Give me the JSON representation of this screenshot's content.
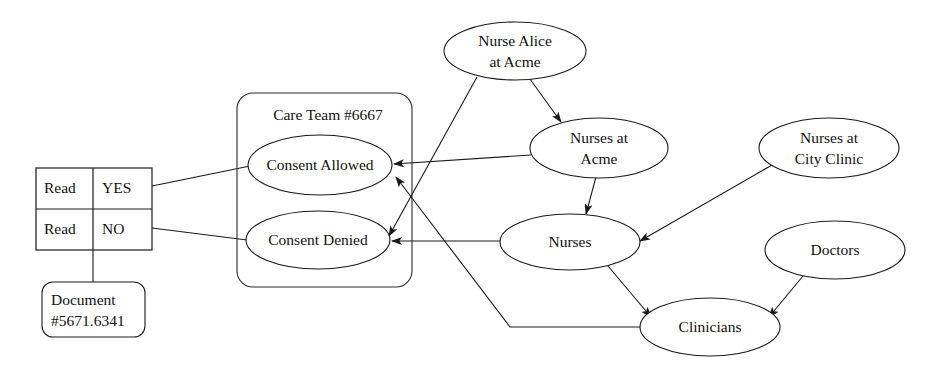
{
  "diagram": {
    "background_color": "#ffffff",
    "line_color": "#1a1a1a",
    "text_color": "#111111"
  },
  "permission_table": {
    "name": "read-permission-table",
    "rows": [
      {
        "action": "Read",
        "value": "YES"
      },
      {
        "action": "Read",
        "value": "NO"
      }
    ]
  },
  "document": {
    "line1": "Document",
    "line2": "#5671.6341"
  },
  "care_team": {
    "label": "Care Team #6667",
    "nodes": [
      {
        "id": "consent-allowed",
        "label": "Consent Allowed"
      },
      {
        "id": "consent-denied",
        "label": "Consent Denied"
      }
    ]
  },
  "actors": [
    {
      "id": "nurse-alice-at-acme",
      "line1": "Nurse Alice",
      "line2": "at Acme"
    },
    {
      "id": "nurses-at-acme",
      "line1": "Nurses at",
      "line2": "Acme"
    },
    {
      "id": "nurses-at-city-clinic",
      "line1": "Nurses at",
      "line2": "City Clinic"
    },
    {
      "id": "nurses",
      "line1": "Nurses",
      "line2": ""
    },
    {
      "id": "doctors",
      "line1": "Doctors",
      "line2": ""
    },
    {
      "id": "clinicians",
      "line1": "Clinicians",
      "line2": ""
    }
  ],
  "edges": [
    {
      "id": "edge-read-yes-to-consent-allowed",
      "from": "read-yes",
      "to": "consent-allowed",
      "arrow": false
    },
    {
      "id": "edge-read-no-to-consent-denied",
      "from": "read-no",
      "to": "consent-denied",
      "arrow": false
    },
    {
      "id": "edge-table-to-document",
      "from": "read-permission-table",
      "to": "document",
      "arrow": false
    },
    {
      "id": "edge-nurse-alice-to-nurses-at-acme",
      "from": "nurse-alice-at-acme",
      "to": "nurses-at-acme",
      "arrow": true
    },
    {
      "id": "edge-nurse-alice-to-consent-denied",
      "from": "nurse-alice-at-acme",
      "to": "consent-denied",
      "arrow": true
    },
    {
      "id": "edge-nurses-at-acme-to-consent-allowed",
      "from": "nurses-at-acme",
      "to": "consent-allowed",
      "arrow": true
    },
    {
      "id": "edge-nurses-at-acme-to-nurses",
      "from": "nurses-at-acme",
      "to": "nurses",
      "arrow": true
    },
    {
      "id": "edge-nurses-at-city-clinic-to-nurses",
      "from": "nurses-at-city-clinic",
      "to": "nurses",
      "arrow": true
    },
    {
      "id": "edge-nurses-to-consent-denied",
      "from": "nurses",
      "to": "consent-denied",
      "arrow": true
    },
    {
      "id": "edge-nurses-to-clinicians",
      "from": "nurses",
      "to": "clinicians",
      "arrow": true
    },
    {
      "id": "edge-doctors-to-clinicians",
      "from": "doctors",
      "to": "clinicians",
      "arrow": true
    },
    {
      "id": "edge-clinicians-to-consent-allowed",
      "from": "clinicians",
      "to": "consent-allowed",
      "arrow": true
    }
  ]
}
